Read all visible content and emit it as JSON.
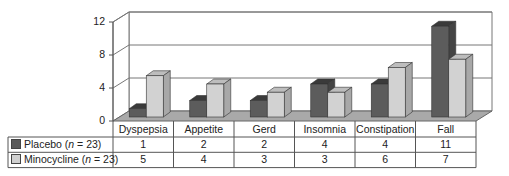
{
  "chart_data": {
    "type": "bar",
    "title": "",
    "xlabel": "",
    "ylabel": "",
    "ylim": [
      0,
      12
    ],
    "yticks": [
      "0",
      "4",
      "8",
      "12"
    ],
    "categories": [
      "Dyspepsia",
      "Appetite",
      "Gerd",
      "Insomnia",
      "Constipation",
      "Fall"
    ],
    "series": [
      {
        "name": "Placebo",
        "n_label": "n",
        "n_value": "= 23)",
        "label_prefix": "Placebo (",
        "values": [
          1,
          2,
          2,
          4,
          4,
          11
        ],
        "color": "#5a5a5a"
      },
      {
        "name": "Minocycline",
        "n_label": "n",
        "n_value": "= 23)",
        "label_prefix": "Minocycline (",
        "values": [
          5,
          4,
          3,
          3,
          6,
          7
        ],
        "color": "#cfcfcf"
      }
    ],
    "grid": true,
    "style": "3d-column with data table below",
    "legend_position": "table-rows"
  },
  "table": {
    "rows": [
      {
        "cells": [
          "1",
          "2",
          "2",
          "4",
          "4",
          "11"
        ]
      },
      {
        "cells": [
          "5",
          "4",
          "3",
          "3",
          "6",
          "7"
        ]
      }
    ]
  }
}
